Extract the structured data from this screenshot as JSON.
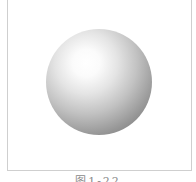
{
  "figure": {
    "image_description": "shaded 3D sphere with upper-left highlight",
    "caption": "图1-22"
  }
}
